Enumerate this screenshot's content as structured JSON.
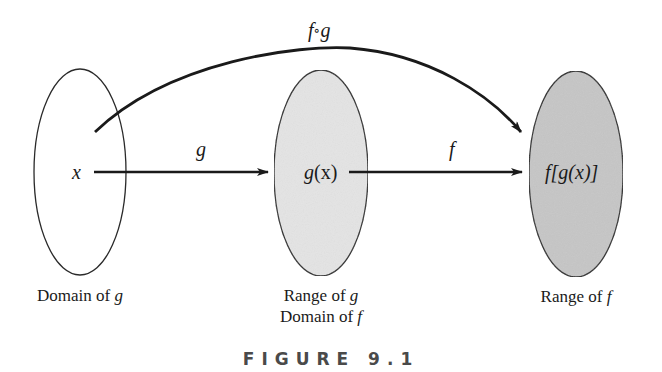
{
  "diagram": {
    "sets": [
      {
        "id": "domain-g",
        "element": "x",
        "label_lines": [
          "Domain of g"
        ],
        "fill": "#ffffff"
      },
      {
        "id": "range-g",
        "element": "g(x)",
        "label_lines": [
          "Range of g",
          "Domain of f"
        ],
        "fill": "#e4e4e4"
      },
      {
        "id": "range-f",
        "element": "f[g(x)]",
        "label_lines": [
          "Range of f"
        ],
        "fill": "#c6c6c6"
      }
    ],
    "arrows": [
      {
        "id": "g",
        "label": "g",
        "from": "x",
        "to": "g(x)"
      },
      {
        "id": "f",
        "label": "f",
        "from": "g(x)",
        "to": "f[g(x)]"
      },
      {
        "id": "fog",
        "label": "f∘g",
        "from": "x",
        "to": "f[g(x)]"
      }
    ],
    "labels": {
      "x": "x",
      "gx_g": "g",
      "gx_paren": "(x)",
      "fgx": "f[g(x)]",
      "arrow_g": "g",
      "arrow_f": "f",
      "compose_f": "f",
      "compose_circ": "∘",
      "compose_g": "g",
      "domain_g_text": "Domain of ",
      "domain_g_var": "g",
      "range_g_text": "Range of ",
      "range_g_var": "g",
      "domain_f_text": "Domain of ",
      "domain_f_var": "f",
      "range_f_text": "Range of ",
      "range_f_var": "f"
    },
    "caption": "FIGURE 9.1"
  }
}
